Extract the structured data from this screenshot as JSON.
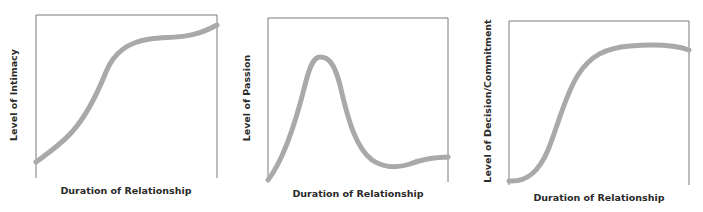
{
  "chart_data": [
    {
      "type": "line",
      "title": "",
      "xlabel": "Duration of Relationship",
      "ylabel": "Level of Intimacy",
      "grid": false,
      "legend": null,
      "x_ticks": [],
      "y_ticks": [],
      "description": "Intimacy rises steadily, steepens, levels off to a plateau, then rises slightly again",
      "x": [
        0,
        0.15,
        0.32,
        0.4,
        0.49,
        0.63,
        0.8,
        1.0
      ],
      "values": [
        0.1,
        0.23,
        0.48,
        0.69,
        0.81,
        0.85,
        0.86,
        0.93
      ],
      "line_color": "#a9a9a9"
    },
    {
      "type": "line",
      "title": "",
      "xlabel": "Duration of Relationship",
      "ylabel": "Level of Passion",
      "grid": false,
      "legend": null,
      "x_ticks": [],
      "y_ticks": [],
      "description": "Passion rises rapidly to an early peak, falls sharply, then levels off at a moderate level",
      "x": [
        0,
        0.12,
        0.2,
        0.29,
        0.37,
        0.46,
        0.6,
        0.71,
        0.84,
        1.0
      ],
      "values": [
        0.01,
        0.26,
        0.62,
        0.76,
        0.65,
        0.32,
        0.1,
        0.08,
        0.13,
        0.15
      ],
      "line_color": "#a9a9a9"
    },
    {
      "type": "line",
      "title": "",
      "xlabel": "Duration of Relationship",
      "ylabel": "Level of Decision/Commitment",
      "grid": false,
      "legend": null,
      "x_ticks": [],
      "y_ticks": [],
      "description": "Commitment starts near zero, rises in an S-curve, plateaus high, then dips slightly",
      "x": [
        0,
        0.12,
        0.26,
        0.37,
        0.51,
        0.67,
        0.84,
        1.0
      ],
      "values": [
        0.02,
        0.06,
        0.34,
        0.64,
        0.8,
        0.85,
        0.85,
        0.82
      ],
      "line_color": "#a9a9a9"
    }
  ],
  "panels": [
    {
      "ylabel": "Level of Intimacy",
      "xlabel": "Duration of Relationship",
      "frame": {
        "left": 36,
        "top": 15,
        "right": 217,
        "bottom": 178
      },
      "path": "M36,162 C50,152 62,143 72,132 C88,114 98,92 106,72 C114,52 128,42 150,39 C172,36 190,40 217,25"
    },
    {
      "ylabel": "Level of Passion",
      "xlabel": "Duration of Relationship",
      "frame": {
        "left": 268,
        "top": 18,
        "right": 448,
        "bottom": 182
      },
      "path": "M268,180 C282,162 295,125 305,85 C310,65 314,57 320,57 C328,57 334,62 340,85 C348,120 356,148 372,160 C384,168 398,168 410,164 C425,158 435,158 448,157"
    },
    {
      "ylabel": "Level of Decision/Commitment",
      "xlabel": "Duration of Relationship",
      "frame": {
        "left": 509,
        "top": 21,
        "right": 689,
        "bottom": 185
      },
      "path": "M509,181 C525,182 538,174 548,150 C558,126 565,95 578,75 C590,56 605,48 630,46 C655,44 675,45 689,50"
    }
  ],
  "colors": {
    "curve": "#a9a9a9",
    "frame": "#7a7a7a",
    "text": "#2a2a2a"
  }
}
